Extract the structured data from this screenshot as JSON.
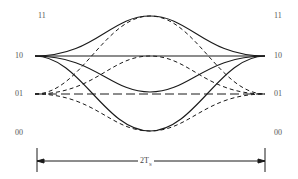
{
  "diagram": {
    "type": "eye/trellis diagram of symbol transitions",
    "levels": [
      {
        "label": "11",
        "y": 16
      },
      {
        "label": "10",
        "y": 56
      },
      {
        "label": "01",
        "y": 94
      },
      {
        "label": "00",
        "y": 133
      }
    ],
    "left_labels": [
      "11",
      "10",
      "01",
      "00"
    ],
    "right_labels": [
      "11",
      "10",
      "01",
      "00"
    ],
    "span": {
      "label_main": "2T",
      "label_sub": "S"
    },
    "colors": {
      "line": "#1a1a1a",
      "label": "#555555"
    }
  }
}
